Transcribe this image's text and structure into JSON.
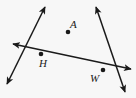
{
  "figure": {
    "background_color": "#f7f7f7",
    "stroke_color": "#1a1a1a",
    "width": 136,
    "height": 98,
    "points": [
      {
        "id": "A",
        "label": "A",
        "x": 68,
        "y": 32,
        "label_x": 70,
        "label_y": 28
      },
      {
        "id": "H",
        "label": "H",
        "x": 41,
        "y": 54,
        "label_x": 39,
        "label_y": 67
      },
      {
        "id": "W",
        "label": "W",
        "x": 103,
        "y": 70,
        "label_x": 90,
        "label_y": 82
      }
    ],
    "lines": [
      {
        "id": "line-A-H",
        "name": "line-through-a-and-h",
        "from": {
          "x": 45,
          "y": 7
        },
        "to": {
          "x": 7,
          "y": 84
        },
        "arrow_start": true,
        "arrow_end": true,
        "passes_through": [
          "A",
          "H"
        ]
      },
      {
        "id": "line-A-W",
        "name": "line-through-a-and-w",
        "from": {
          "x": 96,
          "y": 7
        },
        "to": {
          "x": 125,
          "y": 92
        },
        "arrow_start": true,
        "arrow_end": true,
        "passes_through": [
          "A",
          "W"
        ]
      },
      {
        "id": "line-H-W",
        "name": "line-through-h-and-w",
        "from": {
          "x": 13,
          "y": 44
        },
        "to": {
          "x": 131,
          "y": 69
        },
        "arrow_start": true,
        "arrow_end": true,
        "passes_through": [
          "H",
          "W"
        ]
      }
    ]
  }
}
